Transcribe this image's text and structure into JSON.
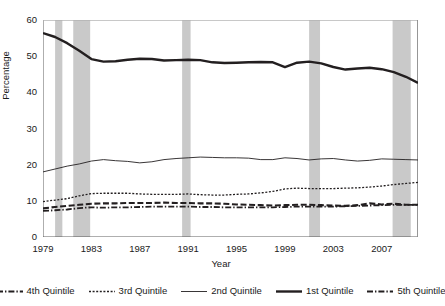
{
  "chart_data": {
    "type": "line",
    "title": "",
    "xlabel": "Year",
    "ylabel": "Percentage",
    "xlim": [
      1979,
      2010
    ],
    "ylim": [
      0,
      60
    ],
    "yticks": [
      0,
      10,
      20,
      30,
      40,
      50,
      60
    ],
    "xticks": [
      1979,
      1983,
      1987,
      1991,
      1995,
      1999,
      2003,
      2007
    ],
    "x_minor_tick_interval": 1,
    "grid": false,
    "legend_position": "bottom",
    "x": [
      1979,
      1980,
      1981,
      1982,
      1983,
      1984,
      1985,
      1986,
      1987,
      1988,
      1989,
      1990,
      1991,
      1992,
      1993,
      1994,
      1995,
      1996,
      1997,
      1998,
      1999,
      2000,
      2001,
      2002,
      2003,
      2004,
      2005,
      2006,
      2007,
      2008,
      2009,
      2010
    ],
    "series": [
      {
        "name": "1st Quintile",
        "style": "solid-thick",
        "color": "#231f20",
        "values": [
          56.4,
          55.3,
          53.6,
          51.5,
          49.2,
          48.5,
          48.6,
          49.0,
          49.3,
          49.2,
          48.8,
          48.9,
          49.0,
          48.9,
          48.3,
          48.1,
          48.2,
          48.3,
          48.4,
          48.3,
          47.0,
          48.2,
          48.5,
          48.0,
          47.0,
          46.3,
          46.6,
          46.8,
          46.4,
          45.6,
          44.3,
          42.6
        ]
      },
      {
        "name": "2nd Quintile",
        "style": "solid-thin",
        "color": "#231f20",
        "values": [
          18.0,
          18.8,
          19.6,
          20.2,
          21.0,
          21.4,
          21.1,
          20.9,
          20.5,
          20.8,
          21.4,
          21.7,
          21.9,
          22.1,
          22.0,
          21.9,
          21.9,
          21.8,
          21.4,
          21.4,
          21.9,
          21.7,
          21.3,
          21.6,
          21.7,
          21.3,
          21.0,
          21.2,
          21.6,
          21.5,
          21.4,
          21.3
        ]
      },
      {
        "name": "3rd Quintile",
        "style": "dotted",
        "color": "#231f20",
        "values": [
          9.8,
          10.2,
          10.6,
          11.4,
          12.0,
          12.1,
          12.1,
          12.1,
          11.9,
          11.8,
          11.8,
          11.8,
          11.9,
          11.7,
          11.6,
          11.6,
          11.8,
          11.9,
          12.2,
          12.6,
          13.3,
          13.5,
          13.4,
          13.4,
          13.4,
          13.5,
          13.6,
          13.8,
          14.1,
          14.5,
          14.8,
          15.1
        ]
      },
      {
        "name": "4th Quintile",
        "style": "dashed",
        "color": "#231f20",
        "values": [
          7.9,
          8.3,
          8.6,
          8.9,
          9.2,
          9.3,
          9.3,
          9.4,
          9.4,
          9.4,
          9.5,
          9.4,
          9.4,
          9.3,
          9.3,
          9.2,
          9.0,
          8.9,
          8.8,
          8.7,
          8.8,
          8.9,
          8.9,
          8.8,
          8.7,
          8.6,
          8.8,
          9.3,
          9.0,
          9.2,
          8.9,
          8.9
        ]
      },
      {
        "name": "5th Quintile",
        "style": "dash-dot",
        "color": "#231f20",
        "values": [
          7.2,
          7.4,
          7.6,
          8.0,
          8.2,
          8.1,
          8.2,
          8.2,
          8.3,
          8.4,
          8.4,
          8.4,
          8.4,
          8.3,
          8.3,
          8.2,
          8.2,
          8.2,
          8.2,
          8.2,
          8.3,
          8.4,
          8.4,
          8.4,
          8.4,
          8.5,
          8.6,
          8.7,
          8.8,
          8.9,
          8.9,
          8.9
        ]
      }
    ],
    "shaded_bands": [
      {
        "label": "recession-1980",
        "start": 1980.0,
        "end": 1980.6
      },
      {
        "label": "recession-1981-82",
        "start": 1981.5,
        "end": 1982.9
      },
      {
        "label": "recession-1990-91",
        "start": 1990.5,
        "end": 1991.2
      },
      {
        "label": "recession-2001",
        "start": 2001.0,
        "end": 2001.9
      },
      {
        "label": "recession-2007-09",
        "start": 2007.9,
        "end": 2009.4
      }
    ],
    "band_color": "#c9c9c9"
  },
  "axis": {
    "y_title": "Percentage",
    "x_title": "Year",
    "y_tick_labels": [
      "0",
      "10",
      "20",
      "30",
      "40",
      "50",
      "60"
    ],
    "x_tick_labels": [
      "1979",
      "1983",
      "1987",
      "1991",
      "1995",
      "1999",
      "2003",
      "2007"
    ]
  },
  "legend": {
    "items": [
      {
        "label": "4th Quintile",
        "style": "dash-dot"
      },
      {
        "label": "3rd Quintile",
        "style": "dotted"
      },
      {
        "label": "2nd Quintile",
        "style": "solid-thin"
      },
      {
        "label": "1st Quintile",
        "style": "solid-thick"
      },
      {
        "label": "5th Quintile",
        "style": "dash-dot"
      }
    ]
  }
}
